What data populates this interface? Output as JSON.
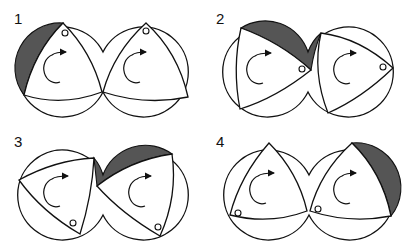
{
  "figure": {
    "colors": {
      "line": "#111111",
      "shaded_chamber": "#555555",
      "background": "#ffffff"
    },
    "panels": [
      {
        "label": "1",
        "shaded": "left housing, upper-left chamber"
      },
      {
        "label": "2",
        "shaded": "upper chamber across both housings"
      },
      {
        "label": "3",
        "shaded": "upper chamber across both housings (advanced)"
      },
      {
        "label": "4",
        "shaded": "right housing, upper-right chamber"
      }
    ],
    "icons": {
      "rotation": "clockwise-arrow-icon",
      "port": "port-circle-icon"
    }
  }
}
